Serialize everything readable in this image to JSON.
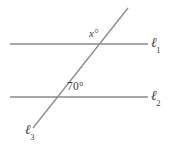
{
  "figure": {
    "type": "geometry-diagram",
    "background_color": "#ffffff",
    "line_color": "#8a8a8a",
    "text_color": "#3d3d3d",
    "width": 178,
    "height": 150
  },
  "lines": {
    "l1": {
      "label": "ℓ",
      "subscript": "1",
      "x1": 10,
      "y1": 44,
      "x2": 148,
      "y2": 44
    },
    "l2": {
      "label": "ℓ",
      "subscript": "2",
      "x1": 10,
      "y1": 97,
      "x2": 148,
      "y2": 97
    },
    "l3": {
      "label": "ℓ",
      "subscript": "3",
      "x1": 33,
      "y1": 128,
      "x2": 128,
      "y2": 8
    }
  },
  "angles": {
    "x": {
      "text": "x°",
      "value": "x",
      "unit": "°"
    },
    "seventy": {
      "text": "70°",
      "value": "70",
      "unit": "°"
    }
  },
  "chart_data": {
    "type": "diagram",
    "title": "",
    "elements": [
      {
        "name": "l1",
        "kind": "line",
        "label": "ℓ1",
        "from": [
          10,
          44
        ],
        "to": [
          148,
          44
        ]
      },
      {
        "name": "l2",
        "kind": "line",
        "label": "ℓ2",
        "from": [
          10,
          97
        ],
        "to": [
          148,
          97
        ]
      },
      {
        "name": "l3",
        "kind": "transversal",
        "label": "ℓ3",
        "from": [
          33,
          128
        ],
        "to": [
          128,
          8
        ]
      },
      {
        "name": "intersection-l3-l1",
        "kind": "point",
        "at": [
          97,
          44
        ]
      },
      {
        "name": "intersection-l3-l2",
        "kind": "point",
        "at": [
          55,
          97
        ]
      },
      {
        "name": "angle-x",
        "kind": "angle-label",
        "text": "x°",
        "at": [
          95,
          34
        ]
      },
      {
        "name": "angle-70",
        "kind": "angle-label",
        "text": "70°",
        "at": [
          78,
          87
        ]
      }
    ]
  }
}
